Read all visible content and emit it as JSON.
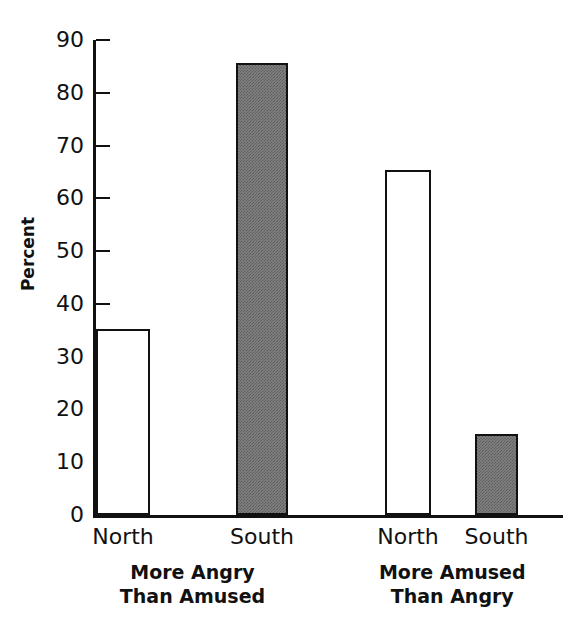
{
  "chart_data": {
    "type": "bar",
    "title": "",
    "xlabel": "",
    "ylabel": "Percent",
    "ylim": [
      0,
      90
    ],
    "yticks": [
      0,
      10,
      20,
      30,
      40,
      50,
      60,
      70,
      80,
      90
    ],
    "ytick_labels": [
      "0",
      "10",
      "20",
      "30",
      "40",
      "50",
      "60",
      "70",
      "80",
      "90"
    ],
    "grid": false,
    "legend": "none",
    "categories": [
      "North",
      "South",
      "North",
      "South"
    ],
    "values": [
      35.3,
      85.7,
      65.4,
      15.4
    ],
    "bars": [
      {
        "label": "North",
        "value": 35.3,
        "fill": "open",
        "group": "More Angry Than Amused"
      },
      {
        "label": "South",
        "value": 85.7,
        "fill": "filled",
        "group": "More Angry Than Amused"
      },
      {
        "label": "North",
        "value": 65.4,
        "fill": "open",
        "group": "More Amused Than Angry"
      },
      {
        "label": "South",
        "value": 15.4,
        "fill": "filled",
        "group": "More Amused Than Angry"
      }
    ],
    "groups": [
      {
        "line1": "More Angry",
        "line2": "Than Amused"
      },
      {
        "line1": "More Amused",
        "line2": "Than Angry"
      }
    ],
    "colors": {
      "axis": "#111111",
      "bar_open_fill": "#ffffff",
      "bar_open_edge": "#111111",
      "bar_filled_fill": "#808080",
      "bar_filled_edge": "#111111",
      "background": "#ffffff"
    }
  }
}
